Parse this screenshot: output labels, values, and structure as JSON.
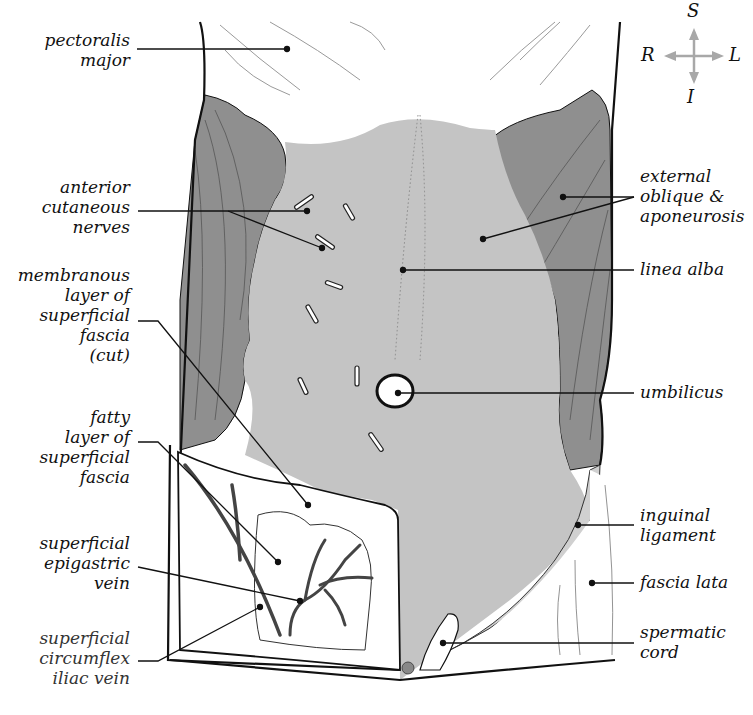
{
  "figure": {
    "colors": {
      "muscle_dark": "#8f8f8f",
      "aponeurosis_light": "#c4c4c4",
      "fascia_white": "#ffffff",
      "outline": "#111111",
      "compass_arrow": "#a8a8a8",
      "vein": "#6e6e6e"
    }
  },
  "compass": {
    "superior": "S",
    "inferior": "I",
    "right": "R",
    "left": "L"
  },
  "labels_left": [
    {
      "id": "pectoralis-major",
      "text": "pectoralis\nmajor"
    },
    {
      "id": "anterior-cutaneous-nerves",
      "text": "anterior\ncutaneous\nnerves"
    },
    {
      "id": "membranous-layer",
      "text": "membranous\nlayer of\nsuperficial\nfascia\n(cut)"
    },
    {
      "id": "fatty-layer",
      "text": "fatty\nlayer of\nsuperficial\nfascia"
    },
    {
      "id": "superficial-epigastric-vein",
      "text": "superficial\nepigastric\nvein"
    },
    {
      "id": "superficial-circumflex-iliac-vein",
      "text": "superficial\ncircumflex\niliac vein"
    }
  ],
  "labels_right": [
    {
      "id": "external-oblique",
      "text": "external\noblique &\naponeurosis"
    },
    {
      "id": "linea-alba",
      "text": "linea alba"
    },
    {
      "id": "umbilicus",
      "text": "umbilicus"
    },
    {
      "id": "inguinal-ligament",
      "text": "inguinal\nligament"
    },
    {
      "id": "fascia-lata",
      "text": "fascia lata"
    },
    {
      "id": "spermatic-cord",
      "text": "spermatic\ncord"
    }
  ]
}
